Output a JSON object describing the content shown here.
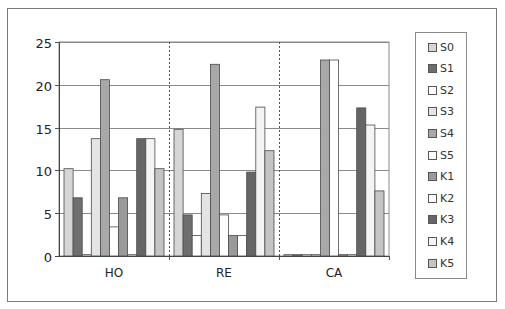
{
  "chart_data": {
    "type": "bar",
    "title": "",
    "xlabel": "",
    "ylabel": "",
    "categories": [
      "HO",
      "RE",
      "CA"
    ],
    "ylim": [
      0,
      25
    ],
    "yticks": [
      "0",
      "5",
      "10",
      "15",
      "20",
      "25"
    ],
    "grid": true,
    "legend_position": "right",
    "series": [
      {
        "name": "S0",
        "color": "#d6d6d6",
        "values": [
          10.2,
          14.8,
          0
        ]
      },
      {
        "name": "S1",
        "color": "#6e6e6e",
        "values": [
          6.8,
          4.8,
          0
        ]
      },
      {
        "name": "S2",
        "color": "#ffffff",
        "values": [
          0.1,
          2.4,
          0
        ]
      },
      {
        "name": "S3",
        "color": "#e4e4e4",
        "values": [
          13.7,
          7.3,
          0
        ]
      },
      {
        "name": "S4",
        "color": "#a8a8a8",
        "values": [
          20.6,
          22.4,
          22.9
        ]
      },
      {
        "name": "S5",
        "color": "#ffffff",
        "values": [
          3.4,
          4.8,
          22.9
        ]
      },
      {
        "name": "K1",
        "color": "#9a9a9a",
        "values": [
          6.8,
          2.4,
          0
        ]
      },
      {
        "name": "K2",
        "color": "#ffffff",
        "values": [
          0.1,
          2.4,
          0
        ]
      },
      {
        "name": "K3",
        "color": "#666666",
        "values": [
          13.7,
          9.8,
          17.3
        ]
      },
      {
        "name": "K4",
        "color": "#f4f4f4",
        "values": [
          13.7,
          17.4,
          15.3
        ]
      },
      {
        "name": "K5",
        "color": "#c4c4c4",
        "values": [
          10.2,
          12.3,
          7.6
        ]
      }
    ]
  }
}
